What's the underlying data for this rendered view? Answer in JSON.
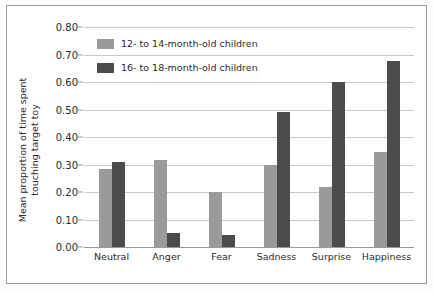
{
  "chart_data": {
    "type": "bar",
    "title": "",
    "xlabel": "",
    "ylabel": "Mean proportion of time spent touching target toy",
    "ylabel_lines": [
      "Mean proportion of time spent",
      "touching target toy"
    ],
    "ylim": [
      0.0,
      0.8
    ],
    "ytick_labels": [
      "0.80",
      "0.70",
      "0.60",
      "0.50",
      "0.40",
      "0.30",
      "0.20",
      "0.10",
      "0.00"
    ],
    "ytick_values": [
      0.8,
      0.7,
      0.6,
      0.5,
      0.4,
      0.3,
      0.2,
      0.1,
      0.0
    ],
    "grid": true,
    "legend_position": "top-left-inside",
    "categories": [
      "Neutral",
      "Anger",
      "Fear",
      "Sadness",
      "Surprise",
      "Happiness"
    ],
    "series": [
      {
        "name": "12- to 14-month-old children",
        "color": "#9a9a9a",
        "values": [
          0.285,
          0.315,
          0.2,
          0.3,
          0.22,
          0.345
        ]
      },
      {
        "name": "16- to 18-month-old children",
        "color": "#4c4c4c",
        "values": [
          0.31,
          0.05,
          0.045,
          0.49,
          0.6,
          0.675
        ]
      }
    ]
  }
}
